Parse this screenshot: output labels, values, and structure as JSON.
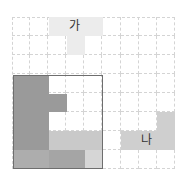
{
  "diagram": {
    "grid": {
      "cols": 9,
      "rows": 8,
      "origin_x": 12,
      "origin_y": 17,
      "cell_w": 18.1,
      "cell_h": 19
    },
    "labels": {
      "piece_a": "가",
      "piece_b": "나"
    },
    "colors": {
      "grid_line": "#d4d4d4",
      "square_border": "#6e6e6e",
      "piece_a": "#ececec",
      "piece_b": "#cfcfcf",
      "dark": "#9a9a9a",
      "medium": "#adadad",
      "medium_dark": "#a5a5a5",
      "light": "#c9c9c9",
      "lighter": "#d6d6d6"
    }
  }
}
